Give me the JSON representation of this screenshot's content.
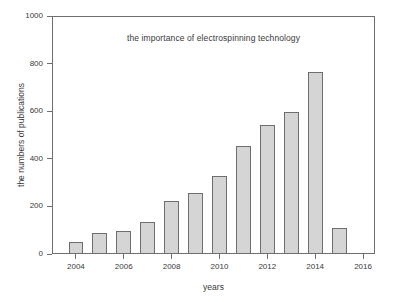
{
  "chart_data": {
    "type": "bar",
    "title": "the importance of electrospinning technology",
    "xlabel": "years",
    "ylabel": "the numbers of publications",
    "categories": [
      2004,
      2005,
      2006,
      2007,
      2008,
      2009,
      2010,
      2011,
      2012,
      2013,
      2014,
      2015
    ],
    "values": [
      55,
      92,
      100,
      137,
      227,
      260,
      332,
      458,
      546,
      601,
      770,
      113
    ],
    "xlim": [
      2003,
      2016.5
    ],
    "ylim": [
      0,
      1000
    ],
    "xticks": [
      2004,
      2006,
      2008,
      2010,
      2012,
      2014,
      2016
    ],
    "yticks": [
      0,
      200,
      400,
      600,
      800,
      1000
    ],
    "xtick_labels": [
      "2004",
      "2006",
      "2008",
      "2010",
      "2012",
      "2014",
      "2016"
    ],
    "ytick_labels": [
      "0",
      "200",
      "400",
      "600",
      "800",
      "1000"
    ],
    "grid": false,
    "legend": null,
    "bar_fill_color": "#d5d5d5",
    "bar_edge_color": "#6e6e6e",
    "axis_color": "#6e6e6e",
    "text_color": "#3a3a3a",
    "background_color": "#ffffff",
    "bar_width_years": 0.62
  }
}
